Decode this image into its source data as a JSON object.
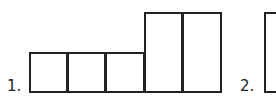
{
  "figures": [
    {
      "label": "1.",
      "description": "Three unit squares in a row followed by two tall rectangles (double height)",
      "cells": [
        {
          "x": 29,
          "y": 52,
          "w": 39,
          "h": 41
        },
        {
          "x": 67,
          "y": 52,
          "w": 39,
          "h": 41
        },
        {
          "x": 105,
          "y": 52,
          "w": 40,
          "h": 41
        },
        {
          "x": 144,
          "y": 12,
          "w": 39,
          "h": 81
        },
        {
          "x": 182,
          "y": 12,
          "w": 40,
          "h": 81
        }
      ]
    },
    {
      "label": "2.",
      "description": "Partially visible tall rectangle",
      "cells": [
        {
          "x": 264,
          "y": 12,
          "w": 40,
          "h": 81
        }
      ]
    }
  ]
}
